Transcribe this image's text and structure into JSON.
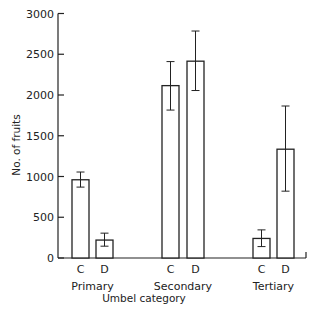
{
  "chart_data": {
    "type": "bar",
    "title": "",
    "xlabel": "Umbel category",
    "ylabel": "No. of fruits",
    "ylim": [
      0,
      3000
    ],
    "yticks": [
      0,
      500,
      1000,
      1500,
      2000,
      2500,
      3000
    ],
    "ytick_labels": [
      "0",
      "500",
      "1000",
      "1500",
      "2000",
      "2500",
      "3000"
    ],
    "grid": false,
    "legend": null,
    "groups": [
      "Primary",
      "Secondary",
      "Tertiary"
    ],
    "subcategories": [
      "C",
      "D"
    ],
    "series": [
      {
        "name": "C",
        "values": [
          960,
          2115,
          240
        ],
        "error_upper": [
          1055,
          2410,
          345
        ],
        "error_lower": [
          870,
          1815,
          140
        ]
      },
      {
        "name": "D",
        "values": [
          220,
          2415,
          1335
        ],
        "error_upper": [
          305,
          2785,
          1865
        ],
        "error_lower": [
          145,
          2055,
          820
        ]
      }
    ],
    "colors": {
      "bar_fill": "#ffffff",
      "bar_stroke": "#222222",
      "axis": "#222222"
    }
  }
}
